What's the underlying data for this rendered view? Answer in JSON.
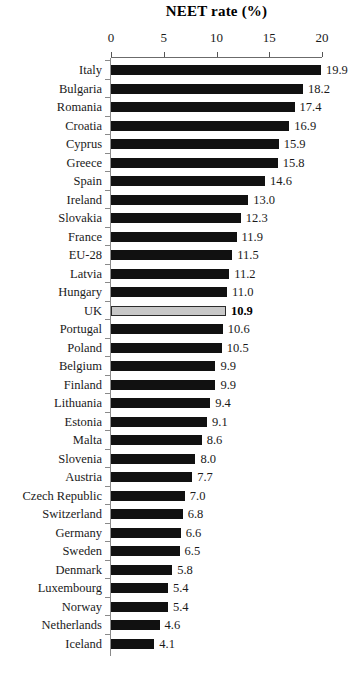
{
  "chart_data": {
    "type": "bar",
    "orientation": "horizontal",
    "title": "NEET rate (%)",
    "xlabel": "",
    "ylabel": "",
    "xlim": [
      0,
      20
    ],
    "xticks": [
      0,
      5,
      10,
      15,
      20
    ],
    "xtick_labels": [
      "0",
      "5",
      "10",
      "15",
      "20"
    ],
    "axis_position": "top",
    "grid": false,
    "legend": null,
    "categories": [
      "Italy",
      "Bulgaria",
      "Romania",
      "Croatia",
      "Cyprus",
      "Greece",
      "Spain",
      "Ireland",
      "Slovakia",
      "France",
      "EU-28",
      "Latvia",
      "Hungary",
      "UK",
      "Portugal",
      "Poland",
      "Belgium",
      "Finland",
      "Lithuania",
      "Estonia",
      "Malta",
      "Slovenia",
      "Austria",
      "Czech Republic",
      "Switzerland",
      "Germany",
      "Sweden",
      "Denmark",
      "Luxembourg",
      "Norway",
      "Netherlands",
      "Iceland"
    ],
    "values": [
      19.9,
      18.2,
      17.4,
      16.9,
      15.9,
      15.8,
      14.6,
      13.0,
      12.3,
      11.9,
      11.5,
      11.2,
      11.0,
      10.9,
      10.6,
      10.5,
      9.9,
      9.9,
      9.4,
      9.1,
      8.6,
      8.0,
      7.7,
      7.0,
      6.8,
      6.6,
      6.5,
      5.8,
      5.4,
      5.4,
      4.6,
      4.1
    ],
    "value_labels": [
      "19.9",
      "18.2",
      "17.4",
      "16.9",
      "15.9",
      "15.8",
      "14.6",
      "13.0",
      "12.3",
      "11.9",
      "11.5",
      "11.2",
      "11.0",
      "10.9",
      "10.6",
      "10.5",
      "9.9",
      "9.9",
      "9.4",
      "9.1",
      "8.6",
      "8.0",
      "7.7",
      "7.0",
      "6.8",
      "6.6",
      "6.5",
      "5.8",
      "5.4",
      "5.4",
      "4.6",
      "4.1"
    ],
    "highlight_category": "UK",
    "colors": {
      "bar": "#111111",
      "bar_highlight": "#c8c8c8",
      "bar_highlight_border": "#2b2b2b",
      "axis": "#6b6b6b",
      "text": "#1a1a1a"
    }
  }
}
